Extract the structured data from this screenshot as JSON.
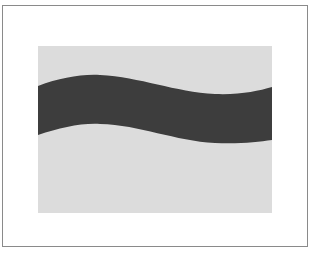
{
  "figure": {
    "frame": {
      "border_color": "#8a8a8a",
      "background": "#ffffff"
    },
    "panel": {
      "fill": "#dcdcdc"
    },
    "wave_band": {
      "fill": "#3d3d3d",
      "description": "dark wavy horizontal band"
    }
  }
}
